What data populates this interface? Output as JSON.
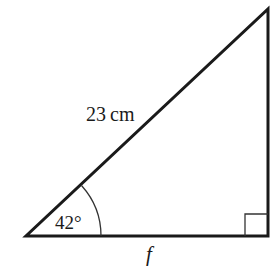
{
  "diagram": {
    "type": "right-triangle",
    "vertices": {
      "angle_vertex": [
        26,
        236
      ],
      "right_angle_vertex": [
        268,
        236
      ],
      "top_vertex": [
        268,
        9
      ]
    },
    "labels": {
      "hypotenuse": "23 cm",
      "angle": "42°",
      "base": "f"
    },
    "colors": {
      "stroke": "#1a1a1a",
      "background": "#ffffff"
    }
  }
}
